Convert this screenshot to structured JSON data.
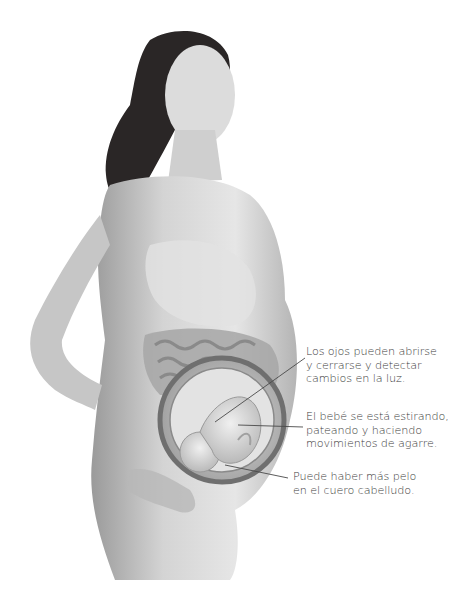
{
  "illustration": {
    "subject": "Pregnant woman in profile with cutaway view of womb showing fetus",
    "style": "grayscale anatomical illustration",
    "colors": {
      "background": "#ffffff",
      "text": "#3c3c3c",
      "leader_line": "#4a4a4a",
      "hair": "#2a2626",
      "skin_light": "#e4e4e4",
      "skin_mid": "#bdbdbd",
      "skin_dark": "#8e8e8e",
      "womb_wall": "#6f6f6f"
    }
  },
  "annotations": [
    {
      "id": "eyes",
      "lines": [
        "Los ojos pueden abrirse",
        "y cerrarse y detectar",
        "cambios en la luz."
      ],
      "leader": {
        "x1": 305,
        "y1": 358,
        "x2": 215,
        "y2": 422
      }
    },
    {
      "id": "movement",
      "lines": [
        "El bebé se está estirando,",
        "pateando y haciendo",
        "movimientos de agarre."
      ],
      "leader": {
        "x1": 303,
        "y1": 427,
        "x2": 238,
        "y2": 425
      }
    },
    {
      "id": "hair",
      "lines": [
        "Puede haber más pelo",
        "en el cuero cabelludo."
      ],
      "leader": {
        "x1": 288,
        "y1": 478,
        "x2": 225,
        "y2": 465
      }
    }
  ]
}
